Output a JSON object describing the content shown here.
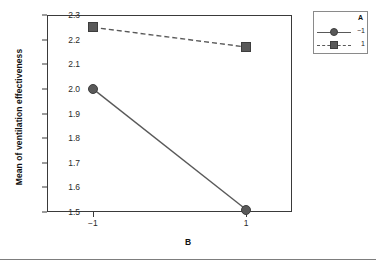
{
  "chart_data": {
    "type": "line",
    "title": "",
    "subtitle": "",
    "xlabel": "B",
    "ylabel": "Mean of ventilation effectiveness",
    "categories": [
      "−1",
      "1"
    ],
    "x": [
      -1,
      1
    ],
    "xlim": [
      -1.6,
      1.6
    ],
    "ylim": [
      1.5,
      2.3
    ],
    "yticks": [
      "2.3",
      "2.2",
      "2.1",
      "2.0",
      "1.9",
      "1.8",
      "1.7",
      "1.6",
      "1.5"
    ],
    "ytick_values": [
      2.3,
      2.2,
      2.1,
      2.0,
      1.9,
      1.8,
      1.7,
      1.6,
      1.5
    ],
    "xticks": [
      "−1",
      "1"
    ],
    "grid": false,
    "legend_position": "top-right-outside",
    "legend_title": "A",
    "series": [
      {
        "name": "−1",
        "values": [
          2.0,
          1.51
        ],
        "style": "solid",
        "marker": "circle",
        "color": "#595959"
      },
      {
        "name": "1",
        "values": [
          2.25,
          2.17
        ],
        "style": "dashed",
        "marker": "square",
        "color": "#595959"
      }
    ]
  },
  "legend": {
    "title": "A",
    "entries": [
      {
        "label": "−1",
        "marker": "circle-marker",
        "line": "solid"
      },
      {
        "label": "1",
        "marker": "square-marker",
        "line": "dashed"
      }
    ]
  },
  "axes": {
    "y_title": "Mean of ventilation effectiveness",
    "x_title": "B"
  },
  "colors": {
    "series": "#595959",
    "frame": "#3a3a3a",
    "text": "#1a1a1a",
    "rule": "#7d7d7d"
  }
}
